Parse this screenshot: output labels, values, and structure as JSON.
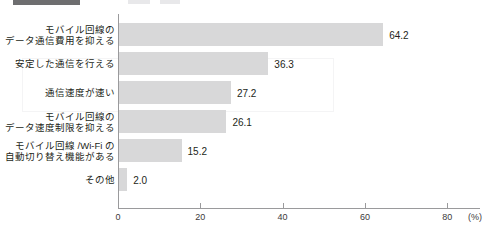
{
  "header": {
    "block_label": "",
    "ghost_a": "",
    "ghost_b": ""
  },
  "chart_data": {
    "type": "bar",
    "orientation": "horizontal",
    "title": "",
    "xlabel": "(%)",
    "ylabel": "",
    "xlim": [
      0,
      80
    ],
    "grid": false,
    "legend": "none",
    "axis_unit": "(%)",
    "tick_labels": [
      "0",
      "20",
      "40",
      "60",
      "80"
    ],
    "tick_values": [
      0,
      20,
      40,
      60,
      80
    ],
    "categories": [
      "モバイル回線の\nデータ通信費用を抑える",
      "安定した通信を行える",
      "通信速度が速い",
      "モバイル回線の\nデータ速度制限を抑える",
      "モバイル回線 /Wi-Fi の\n自動切り替え機能がある",
      "その他"
    ],
    "values": [
      64.2,
      36.3,
      27.2,
      26.1,
      15.2,
      2.0
    ],
    "value_labels": [
      "64.2",
      "36.3",
      "27.2",
      "26.1",
      "15.2",
      "2.0"
    ],
    "bar_color": "#d8d8d9",
    "axis_color": "#9a9a9c",
    "text_color": "#231f20"
  }
}
